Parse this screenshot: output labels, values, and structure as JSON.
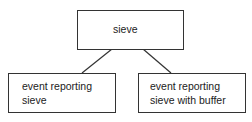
{
  "diagram": {
    "type": "tree",
    "nodes": [
      {
        "id": "root",
        "label": "sieve"
      },
      {
        "id": "left",
        "label_line1": "event reporting",
        "label_line2": "sieve"
      },
      {
        "id": "right",
        "label_line1": "event reporting",
        "label_line2": "sieve with buffer"
      }
    ],
    "edges": [
      {
        "from": "root",
        "to": "left"
      },
      {
        "from": "root",
        "to": "right"
      }
    ]
  }
}
